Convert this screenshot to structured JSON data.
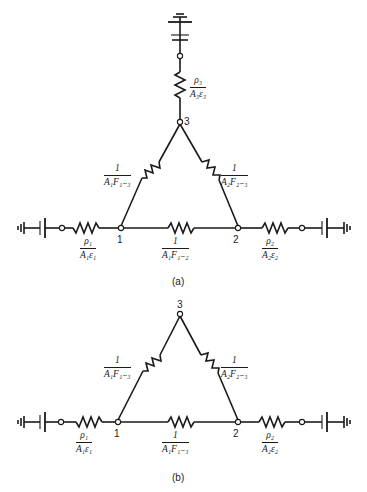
{
  "diagram_a": {
    "caption": "(a)",
    "nodes": {
      "n1": "1",
      "n2": "2",
      "n3": "3"
    },
    "resistors": {
      "r1": {
        "num": "ρ₁",
        "den": "A₁ε₁"
      },
      "r2": {
        "num": "ρ₂",
        "den": "A₂ε₂"
      },
      "r3": {
        "num": "ρ₃",
        "den": "A₃ε₃"
      },
      "r13": {
        "num": "1",
        "den": "A₁F₁₋₃"
      },
      "r23": {
        "num": "1",
        "den": "A₂F₂₋₃"
      },
      "r12": {
        "num": "1",
        "den": "A₁F₁₋₂"
      }
    }
  },
  "diagram_b": {
    "caption": "(b)",
    "nodes": {
      "n1": "1",
      "n2": "2",
      "n3": "3"
    },
    "resistors": {
      "r1": {
        "num": "ρ₁",
        "den": "A₁ε₁"
      },
      "r2": {
        "num": "ρ₂",
        "den": "A₂ε₂"
      },
      "r13": {
        "num": "1",
        "den": "A₁F₁₋₃"
      },
      "r23": {
        "num": "1",
        "den": "A₂F₂₋₃"
      },
      "r12": {
        "num": "1",
        "den": "A₁F₁₋₃"
      }
    }
  }
}
